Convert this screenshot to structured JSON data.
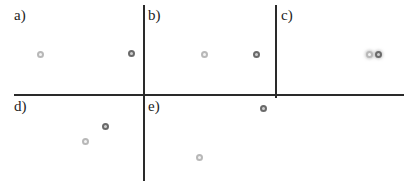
{
  "panels": [
    {
      "id": "a",
      "label": "a)",
      "light": {
        "x": 41,
        "y": 55
      },
      "dark": {
        "x": 132,
        "y": 54
      }
    },
    {
      "id": "b",
      "label": "b)",
      "light": {
        "x": 205,
        "y": 55
      },
      "dark": {
        "x": 257,
        "y": 55
      }
    },
    {
      "id": "c",
      "label": "c)",
      "light": {
        "x": 370,
        "y": 55
      },
      "dark": {
        "x": 379,
        "y": 55
      }
    },
    {
      "id": "d",
      "label": "d)",
      "light": {
        "x": 86,
        "y": 142
      },
      "dark": {
        "x": 106,
        "y": 127
      }
    },
    {
      "id": "e",
      "label": "e)",
      "light": {
        "x": 200,
        "y": 158
      },
      "dark": {
        "x": 264,
        "y": 109
      }
    }
  ],
  "colors": {
    "line": "#2a2a2a",
    "light_dot": "#b8b8b8",
    "dark_dot": "#6a6a6a"
  }
}
